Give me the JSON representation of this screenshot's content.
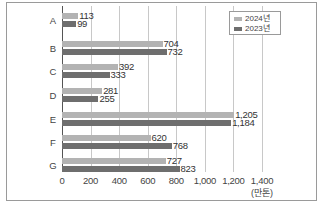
{
  "chart_data": {
    "type": "bar",
    "orientation": "horizontal",
    "title": "",
    "xlabel": "(만톤)",
    "ylabel": "",
    "categories": [
      "A",
      "B",
      "C",
      "D",
      "E",
      "F",
      "G"
    ],
    "series": [
      {
        "name": "2024년",
        "color": "#b3b3b3",
        "values": [
          113,
          704,
          392,
          281,
          1205,
          620,
          727
        ]
      },
      {
        "name": "2023년",
        "color": "#6e6e6e",
        "values": [
          99,
          732,
          333,
          255,
          1184,
          768,
          823
        ]
      }
    ],
    "value_labels": {
      "2024": [
        "113",
        "704",
        "392",
        "281",
        "1,205",
        "620",
        "727"
      ],
      "2023": [
        "99",
        "732",
        "333",
        "255",
        "1,184",
        "768",
        "823"
      ]
    },
    "xlim": [
      0,
      1400
    ],
    "xticks": [
      "0",
      "200",
      "400",
      "600",
      "800",
      "1,000",
      "1,200",
      "1,400"
    ],
    "grid": "vertical",
    "legend_position": "top-right"
  },
  "legend": {
    "items": [
      {
        "label": "2024년"
      },
      {
        "label": "2023년"
      }
    ]
  }
}
